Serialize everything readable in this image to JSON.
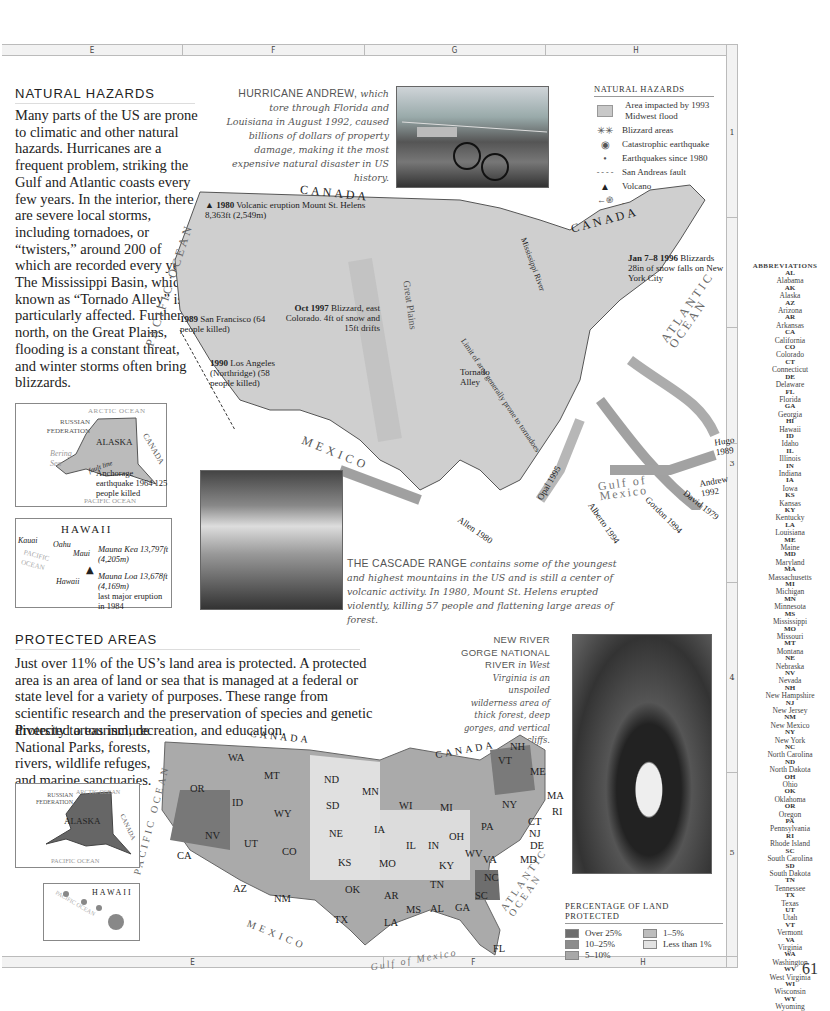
{
  "grid": {
    "columns": [
      "E",
      "F",
      "G",
      "H"
    ],
    "rows": [
      "1",
      "3",
      "4",
      "5"
    ],
    "page_number": "61"
  },
  "natural_hazards": {
    "title": "NATURAL HAZARDS",
    "body": "Many parts of the US are prone to climatic and other natural hazards. Hurricanes are a frequent problem, striking the Gulf and Atlantic coasts every few years. In the interior, there are severe local storms, including tornadoes, or “twisters,” around 200 of which are recorded every year. The Mississippi Basin, which is known as “Tornado Alley” is particularly affected. Further north, on the Great Plains, flooding is a constant threat, and winter storms often bring blizzards.",
    "hurricane_caption_lead": "HURRICANE ANDREW,",
    "hurricane_caption": "which tore through Florida and Louisiana in August 1992, caused billions of dollars of property damage, making it the most expensive natural disaster in US history.",
    "cascade_caption_lead": "THE CASCADE RANGE",
    "cascade_caption": "contains some of the youngest and highest mountains in the US and is still a center of volcanic activity. In 1980, Mount St. Helens erupted violently, killing 57 people and flattening large areas of forest.",
    "legend": {
      "title": "NATURAL HAZARDS",
      "items": [
        {
          "icon": "flood-area-icon",
          "symbol": "▨",
          "label": "Area impacted by 1993 Midwest flood"
        },
        {
          "icon": "blizzard-icon",
          "symbol": "✳✳",
          "label": "Blizzard areas"
        },
        {
          "icon": "catastrophic-earthquake-icon",
          "symbol": "◉",
          "label": "Catastrophic earthquake"
        },
        {
          "icon": "earthquake-icon",
          "symbol": "•",
          "label": "Earthquakes since 1980"
        },
        {
          "icon": "fault-line-icon",
          "symbol": "- - - -",
          "label": "San Andreas fault"
        },
        {
          "icon": "volcano-icon",
          "symbol": "▲",
          "label": "Volcano"
        },
        {
          "icon": "hurricane-icon",
          "symbol": "←֎—",
          "label": "Hurricane"
        },
        {
          "icon": "tornado-icon",
          "symbol": "⮋",
          "label": "Tornado"
        }
      ]
    },
    "map_labels": {
      "canada_west": "CANADA",
      "canada_east": "CANADA",
      "pacific": "PACIFIC OCEAN",
      "atlantic": "ATLANTIC OCEAN",
      "mexico": "MEXICO",
      "gulf": "Gulf of Mexico",
      "great_plains": "Great Plains",
      "mississippi": "Mississippi River",
      "limit": "Limit of area generally prone to tornadoes",
      "tornado_alley": "Tornado Alley",
      "st_helens_year": "1980",
      "st_helens": "Volcanic eruption Mount St. Helens 8,363ft (2,549m)",
      "sf_year": "1989",
      "sf": "San Francisco (64 people killed)",
      "la_year": "1990",
      "la": "Los Angeles (Northridge) (58 people killed)",
      "co_date": "Oct 1997",
      "co": "Blizzard, east Colorado. 4ft of snow and 15ft drifts",
      "ny_date": "Jan 7–8 1996",
      "ny": "Blizzards 28in of snow falls on New York City",
      "hurricanes": [
        "Hugo 1989",
        "Andrew 1992",
        "David 1979",
        "Gordon 1994",
        "Alberto 1994",
        "Opal 1995",
        "Allen 1980"
      ]
    },
    "alaska_inset": {
      "arctic": "ARCTIC OCEAN",
      "russia": "RUSSIAN FEDERATION",
      "alaska": "ALASKA",
      "canada": "CANADA",
      "bering": "Bering Sea",
      "fault": "fault line",
      "quake": "Anchorage earthquake 1964 125 people killed",
      "pacific": "PACIFIC OCEAN"
    },
    "hawaii_inset": {
      "title": "HAWAII",
      "kauai": "Kauai",
      "oahu": "Oahu",
      "maui": "Maui",
      "hawaii": "Hawaii",
      "pacific": "PACIFIC OCEAN",
      "mauna_kea": "Mauna Kea 13,797ft (4,205m)",
      "mauna_loa": "Mauna Loa 13,678ft (4,169m)",
      "mauna_loa_note": "last major eruption in 1984"
    }
  },
  "protected_areas": {
    "title": "PROTECTED AREAS",
    "body_wide": "Just over 11% of the US’s land area is protected. A protected area is an area of land or sea that is managed at a federal or state level for a variety of purposes. These range from scientific research and the preservation of species and genetic diversity to tourism, recreation, and education.",
    "body_narrow": "Protected areas include National Parks, forests, rivers, wildlife refuges, and marine sanctuaries.",
    "gorge_caption_lead": "NEW RIVER GORGE NATIONAL RIVER",
    "gorge_caption": "in West Virginia is an unspoiled wilderness area of thick forest, deep gorges, and vertical cliffs.",
    "legend": {
      "title": "PERCENTAGE OF LAND PROTECTED",
      "items": [
        {
          "label": "Over 25%",
          "color": "#6e6e6e"
        },
        {
          "label": "10–25%",
          "color": "#8c8c8c"
        },
        {
          "label": "5–10%",
          "color": "#a8a8a8"
        },
        {
          "label": "1–5%",
          "color": "#bdbdbd"
        },
        {
          "label": "Less than 1%",
          "color": "#e2e2e2"
        }
      ]
    },
    "map_labels": {
      "canada_west": "CANADA",
      "canada_east": "CANADA",
      "pacific": "PACIFIC OCEAN",
      "atlantic": "ATLANTIC OCEAN",
      "mexico": "MEXICO",
      "gulf": "Gulf of Mexico"
    },
    "states": [
      {
        "abbr": "WA",
        "x": 228,
        "y": 752
      },
      {
        "abbr": "OR",
        "x": 190,
        "y": 783
      },
      {
        "abbr": "CA",
        "x": 177,
        "y": 850
      },
      {
        "abbr": "ID",
        "x": 232,
        "y": 797
      },
      {
        "abbr": "NV",
        "x": 205,
        "y": 830
      },
      {
        "abbr": "MT",
        "x": 264,
        "y": 770
      },
      {
        "abbr": "WY",
        "x": 274,
        "y": 808
      },
      {
        "abbr": "UT",
        "x": 244,
        "y": 838
      },
      {
        "abbr": "CO",
        "x": 282,
        "y": 846
      },
      {
        "abbr": "AZ",
        "x": 233,
        "y": 883
      },
      {
        "abbr": "NM",
        "x": 274,
        "y": 893
      },
      {
        "abbr": "ND",
        "x": 324,
        "y": 774
      },
      {
        "abbr": "SD",
        "x": 326,
        "y": 800
      },
      {
        "abbr": "NE",
        "x": 329,
        "y": 828
      },
      {
        "abbr": "KS",
        "x": 338,
        "y": 857
      },
      {
        "abbr": "OK",
        "x": 345,
        "y": 884
      },
      {
        "abbr": "TX",
        "x": 334,
        "y": 914
      },
      {
        "abbr": "MN",
        "x": 362,
        "y": 786
      },
      {
        "abbr": "IA",
        "x": 374,
        "y": 824
      },
      {
        "abbr": "MO",
        "x": 379,
        "y": 858
      },
      {
        "abbr": "AR",
        "x": 384,
        "y": 890
      },
      {
        "abbr": "LA",
        "x": 384,
        "y": 917
      },
      {
        "abbr": "WI",
        "x": 399,
        "y": 800
      },
      {
        "abbr": "IL",
        "x": 406,
        "y": 840
      },
      {
        "abbr": "MS",
        "x": 406,
        "y": 904
      },
      {
        "abbr": "MI",
        "x": 440,
        "y": 802
      },
      {
        "abbr": "IN",
        "x": 428,
        "y": 840
      },
      {
        "abbr": "KY",
        "x": 439,
        "y": 860
      },
      {
        "abbr": "TN",
        "x": 430,
        "y": 879
      },
      {
        "abbr": "AL",
        "x": 430,
        "y": 903
      },
      {
        "abbr": "GA",
        "x": 455,
        "y": 902
      },
      {
        "abbr": "FL",
        "x": 493,
        "y": 943
      },
      {
        "abbr": "OH",
        "x": 449,
        "y": 831
      },
      {
        "abbr": "WV",
        "x": 465,
        "y": 848
      },
      {
        "abbr": "VA",
        "x": 483,
        "y": 854
      },
      {
        "abbr": "NC",
        "x": 484,
        "y": 872
      },
      {
        "abbr": "SC",
        "x": 475,
        "y": 890
      },
      {
        "abbr": "PA",
        "x": 481,
        "y": 821
      },
      {
        "abbr": "NY",
        "x": 502,
        "y": 799
      },
      {
        "abbr": "NJ",
        "x": 529,
        "y": 828
      },
      {
        "abbr": "DE",
        "x": 530,
        "y": 840
      },
      {
        "abbr": "MD",
        "x": 520,
        "y": 854
      },
      {
        "abbr": "CT",
        "x": 528,
        "y": 816
      },
      {
        "abbr": "RI",
        "x": 552,
        "y": 806
      },
      {
        "abbr": "MA",
        "x": 547,
        "y": 790
      },
      {
        "abbr": "ME",
        "x": 530,
        "y": 766
      },
      {
        "abbr": "VT",
        "x": 498,
        "y": 755
      },
      {
        "abbr": "NH",
        "x": 510,
        "y": 741
      }
    ],
    "alaska_inset": {
      "arctic": "ARCTIC OCEAN",
      "russia": "RUSSIAN FEDERATION",
      "alaska": "ALASKA",
      "canada": "CANADA",
      "pacific": "PACIFIC OCEAN"
    },
    "hawaii_inset": {
      "title": "HAWAII",
      "pacific": "PACIFIC OCEAN"
    }
  },
  "abbreviations": {
    "title": "ABBREVIATIONS",
    "items": [
      [
        "AL",
        "Alabama"
      ],
      [
        "AK",
        "Alaska"
      ],
      [
        "AZ",
        "Arizona"
      ],
      [
        "AR",
        "Arkansas"
      ],
      [
        "CA",
        "California"
      ],
      [
        "CO",
        "Colorado"
      ],
      [
        "CT",
        "Connecticut"
      ],
      [
        "DE",
        "Delaware"
      ],
      [
        "FL",
        "Florida"
      ],
      [
        "GA",
        "Georgia"
      ],
      [
        "HI",
        "Hawaii"
      ],
      [
        "ID",
        "Idaho"
      ],
      [
        "IL",
        "Illinois"
      ],
      [
        "IN",
        "Indiana"
      ],
      [
        "IA",
        "Iowa"
      ],
      [
        "KS",
        "Kansas"
      ],
      [
        "KY",
        "Kentucky"
      ],
      [
        "LA",
        "Louisiana"
      ],
      [
        "ME",
        "Maine"
      ],
      [
        "MD",
        "Maryland"
      ],
      [
        "MA",
        "Massachusetts"
      ],
      [
        "MI",
        "Michigan"
      ],
      [
        "MN",
        "Minnesota"
      ],
      [
        "MS",
        "Mississippi"
      ],
      [
        "MO",
        "Missouri"
      ],
      [
        "MT",
        "Montana"
      ],
      [
        "NE",
        "Nebraska"
      ],
      [
        "NV",
        "Nevada"
      ],
      [
        "NH",
        "New Hampshire"
      ],
      [
        "NJ",
        "New Jersey"
      ],
      [
        "NM",
        "New Mexico"
      ],
      [
        "NY",
        "New York"
      ],
      [
        "NC",
        "North Carolina"
      ],
      [
        "ND",
        "North Dakota"
      ],
      [
        "OH",
        "Ohio"
      ],
      [
        "OK",
        "Oklahoma"
      ],
      [
        "OR",
        "Oregon"
      ],
      [
        "PA",
        "Pennsylvania"
      ],
      [
        "RI",
        "Rhode Island"
      ],
      [
        "SC",
        "South Carolina"
      ],
      [
        "SD",
        "South Dakota"
      ],
      [
        "TN",
        "Tennessee"
      ],
      [
        "TX",
        "Texas"
      ],
      [
        "UT",
        "Utah"
      ],
      [
        "VT",
        "Vermont"
      ],
      [
        "VA",
        "Virginia"
      ],
      [
        "WA",
        "Washington"
      ],
      [
        "WV",
        "West Virginia"
      ],
      [
        "WI",
        "Wisconsin"
      ],
      [
        "WY",
        "Wyoming"
      ]
    ]
  }
}
